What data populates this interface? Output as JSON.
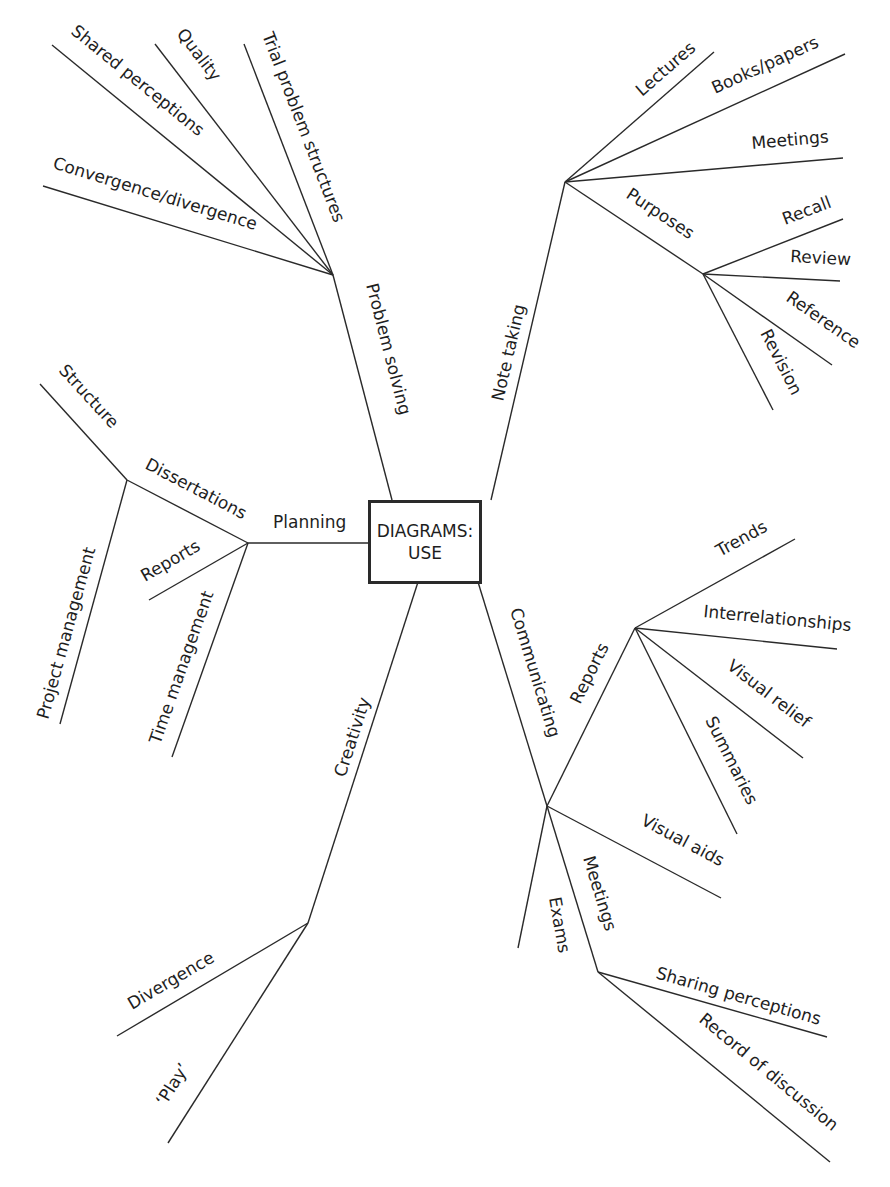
{
  "center": {
    "line1": "DIAGRAMS:",
    "line2": "USE"
  },
  "branches": {
    "problem_solving": {
      "label": "Problem solving",
      "children": [
        "Convergence/divergence",
        "Shared perceptions",
        "Quality",
        "Trial problem structures"
      ]
    },
    "note_taking": {
      "label": "Note taking",
      "children": [
        "Lectures",
        "Books/papers",
        "Meetings",
        "Purposes"
      ],
      "purposes": [
        "Recall",
        "Review",
        "Reference",
        "Revision"
      ]
    },
    "planning": {
      "label": "Planning",
      "children": [
        "Dissertations",
        "Reports",
        "Time management"
      ],
      "dissertations": [
        "Structure",
        "Project management"
      ]
    },
    "creativity": {
      "label": "Creativity",
      "children": [
        "Divergence",
        "‘Play’"
      ]
    },
    "communicating": {
      "label": "Communicating",
      "children": [
        "Reports",
        "Visual aids",
        "Exams",
        "Meetings"
      ],
      "reports": [
        "Trends",
        "Interrelationships",
        "Visual relief",
        "Summaries"
      ],
      "meetings": [
        "Sharing perceptions",
        "Record of discussion"
      ]
    }
  },
  "colors": {
    "line": "#2a2a2a",
    "text": "#1e1e1e",
    "background": "#ffffff"
  }
}
